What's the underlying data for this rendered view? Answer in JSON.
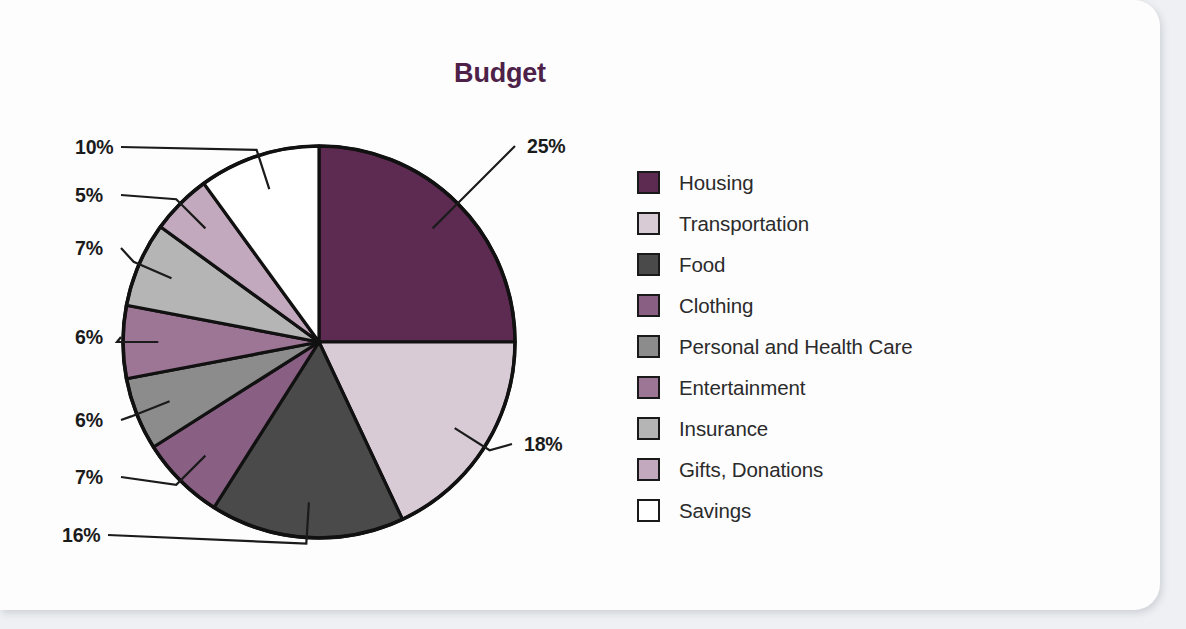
{
  "card": {
    "background_color": "#fdfdfe",
    "page_background_color": "#eef0f3"
  },
  "chart_data": {
    "type": "pie",
    "title": "Budget",
    "xlabel": "",
    "ylabel": "",
    "start_angle_deg": 0,
    "direction": "clockwise",
    "legend_position": "right",
    "grid": false,
    "categories": [
      "Housing",
      "Transportation",
      "Food",
      "Clothing",
      "Personal and Health Care",
      "Entertainment",
      "Insurance",
      "Gifts, Donations",
      "Savings"
    ],
    "values": [
      25,
      18,
      16,
      7,
      6,
      6,
      7,
      5,
      10
    ],
    "value_labels": [
      "25%",
      "18%",
      "16%",
      "7%",
      "6%",
      "6%",
      "7%",
      "5%",
      "10%"
    ],
    "colors": [
      "#5d2b52",
      "#d8cbd6",
      "#4a4a4a",
      "#8a5f84",
      "#8c8c8c",
      "#9d7595",
      "#b5b5b5",
      "#c3a9be",
      "#ffffff"
    ],
    "slice_border_color": "#111111",
    "title_color": "#4e2248",
    "label_color": "#1b1b1b"
  },
  "legend": {
    "items": [
      {
        "label": "Housing",
        "color": "#5d2b52"
      },
      {
        "label": "Transportation",
        "color": "#d8cbd6"
      },
      {
        "label": "Food",
        "color": "#4a4a4a"
      },
      {
        "label": "Clothing",
        "color": "#8a5f84"
      },
      {
        "label": "Personal and Health Care",
        "color": "#8c8c8c"
      },
      {
        "label": "Entertainment",
        "color": "#9d7595"
      },
      {
        "label": "Insurance",
        "color": "#b5b5b5"
      },
      {
        "label": "Gifts, Donations",
        "color": "#c3a9be"
      },
      {
        "label": "Savings",
        "color": "#ffffff"
      }
    ]
  },
  "callouts": [
    {
      "text": "25%",
      "x": 527,
      "y": 135,
      "series": "Housing"
    },
    {
      "text": "18%",
      "x": 524,
      "y": 433,
      "series": "Transportation"
    },
    {
      "text": "16%",
      "x": 62,
      "y": 524,
      "series": "Food"
    },
    {
      "text": "7%",
      "x": 75,
      "y": 466,
      "series": "Clothing"
    },
    {
      "text": "6%",
      "x": 75,
      "y": 409,
      "series": "Personal and Health Care"
    },
    {
      "text": "6%",
      "x": 75,
      "y": 326,
      "series": "Entertainment"
    },
    {
      "text": "7%",
      "x": 75,
      "y": 237,
      "series": "Insurance"
    },
    {
      "text": "5%",
      "x": 75,
      "y": 184,
      "series": "Gifts, Donations"
    },
    {
      "text": "10%",
      "x": 75,
      "y": 136,
      "series": "Savings"
    }
  ]
}
